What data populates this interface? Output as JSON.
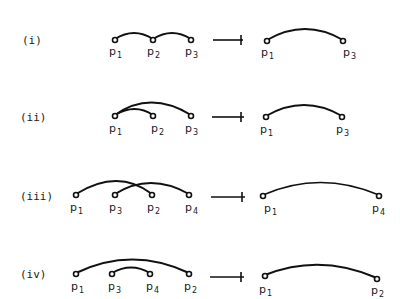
{
  "rows": [
    {
      "label": "(i)",
      "left": {
        "points": [
          {
            "name": "p",
            "sub": "1"
          },
          {
            "name": "p",
            "sub": "2"
          },
          {
            "name": "p",
            "sub": "3"
          }
        ]
      },
      "right": {
        "points": [
          {
            "name": "p",
            "sub": "1"
          },
          {
            "name": "p",
            "sub": "3"
          }
        ]
      }
    },
    {
      "label": "(ii)",
      "left": {
        "points": [
          {
            "name": "p",
            "sub": "1"
          },
          {
            "name": "p",
            "sub": "2"
          },
          {
            "name": "p",
            "sub": "3"
          }
        ]
      },
      "right": {
        "points": [
          {
            "name": "p",
            "sub": "1"
          },
          {
            "name": "p",
            "sub": "3"
          }
        ]
      }
    },
    {
      "label": "(iii)",
      "left": {
        "points": [
          {
            "name": "p",
            "sub": "1"
          },
          {
            "name": "p",
            "sub": "3"
          },
          {
            "name": "p",
            "sub": "2"
          },
          {
            "name": "p",
            "sub": "4"
          }
        ]
      },
      "right": {
        "points": [
          {
            "name": "p",
            "sub": "1"
          },
          {
            "name": "p",
            "sub": "4"
          }
        ]
      }
    },
    {
      "label": "(iv)",
      "left": {
        "points": [
          {
            "name": "p",
            "sub": "1"
          },
          {
            "name": "p",
            "sub": "3"
          },
          {
            "name": "p",
            "sub": "4"
          },
          {
            "name": "p",
            "sub": "2"
          }
        ]
      },
      "right": {
        "points": [
          {
            "name": "p",
            "sub": "1"
          },
          {
            "name": "p",
            "sub": "2"
          }
        ]
      }
    }
  ]
}
